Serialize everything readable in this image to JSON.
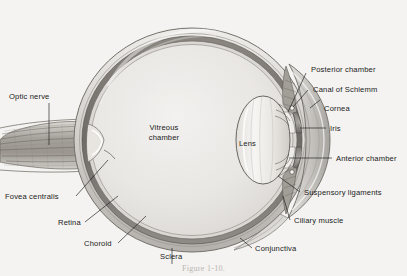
{
  "figure": {
    "background_color": "#f4f3f1",
    "ink_color": "#1a1a1a",
    "caption": "Figure 1-10.",
    "caption_color": "#b9b6b2"
  },
  "labels": {
    "optic_nerve": "Optic nerve",
    "fovea_centralis": "Fovea centralis",
    "retina": "Retina",
    "choroid": "Choroid",
    "sclera": "Sclera",
    "vitreous_chamber_line1": "Vitreous",
    "vitreous_chamber_line2": "chamber",
    "lens": "Lens",
    "posterior_chamber": "Posterior chamber",
    "canal_of_schlemm": "Canal of Schlemm",
    "cornea": "Cornea",
    "iris": "Iris",
    "anterior_chamber": "Anterior chamber",
    "suspensory_ligaments": "Suspensory ligaments",
    "ciliary_muscle": "Ciliary muscle",
    "conjunctiva": "Conjunctiva"
  }
}
